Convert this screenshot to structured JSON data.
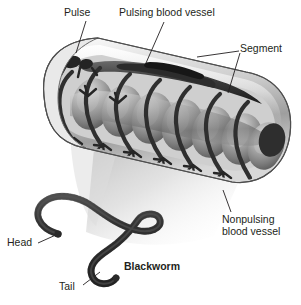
{
  "figure": {
    "background_color": "#ffffff",
    "text_color": "#231f20",
    "labels": {
      "pulse": "Pulse",
      "pulsing_vessel": "Pulsing blood vessel",
      "segment": "Segment",
      "nonpulsing_vessel_line1": "Nonpulsing",
      "nonpulsing_vessel_line2": "blood vessel",
      "head": "Head",
      "tail": "Tail",
      "blackworm": "Blackworm"
    },
    "illustration": {
      "main_subject": "cutaway-worm-body-tube",
      "segment_count": 7,
      "body_tilt_degrees": 15,
      "palette": {
        "body_light": "#e8e8e8",
        "body_mid": "#b4b4b4",
        "body_dark": "#6e6e6e",
        "vessel_dark": "#3a3a3a",
        "vessel_darkest": "#1f1f1f",
        "shadow": "#d0d0d0",
        "outline": "#000000"
      },
      "inset": {
        "name": "whole-blackworm-specimen",
        "shape": "s-curved-coiled-worm"
      }
    }
  }
}
